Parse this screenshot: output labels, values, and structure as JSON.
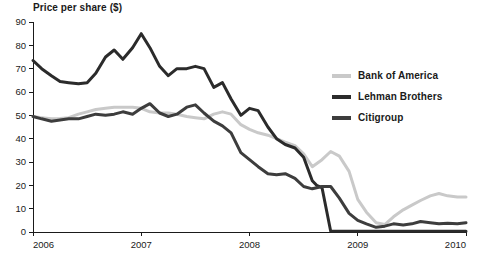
{
  "chart_data": {
    "type": "line",
    "title": "Price per share ($)",
    "xlabel": "",
    "ylabel": "Price per share ($)",
    "xlim": [
      2006,
      2010
    ],
    "ylim": [
      0,
      90
    ],
    "grid": false,
    "legend_position": "right",
    "y_ticks": [
      0,
      10,
      20,
      30,
      40,
      50,
      60,
      70,
      80,
      90
    ],
    "y_tick_labels": [
      "0",
      "10",
      "20",
      "30",
      "40",
      "50",
      "60",
      "70",
      "80",
      "90"
    ],
    "x_ticks": [
      2006,
      2007,
      2008,
      2009,
      2010
    ],
    "x_tick_labels": [
      "2006",
      "2007",
      "2008",
      "2009",
      "2010"
    ],
    "series": [
      {
        "name": "Bank of America",
        "color": "#c9c9c9",
        "width": 3.0,
        "x": [
          2006.0,
          2006.08,
          2006.17,
          2006.25,
          2006.33,
          2006.42,
          2006.5,
          2006.58,
          2006.67,
          2006.75,
          2006.83,
          2006.92,
          2007.0,
          2007.08,
          2007.17,
          2007.25,
          2007.33,
          2007.42,
          2007.5,
          2007.58,
          2007.67,
          2007.75,
          2007.83,
          2007.92,
          2008.0,
          2008.08,
          2008.17,
          2008.25,
          2008.33,
          2008.42,
          2008.5,
          2008.58,
          2008.67,
          2008.75,
          2008.83,
          2008.92,
          2009.0,
          2009.08,
          2009.17,
          2009.25,
          2009.33,
          2009.42,
          2009.5,
          2009.58,
          2009.67,
          2009.75,
          2009.83,
          2009.92,
          2010.0
        ],
        "values": [
          49.5,
          49.0,
          48.5,
          48.6,
          49.0,
          50.5,
          51.5,
          52.5,
          53.0,
          53.5,
          53.5,
          53.5,
          53.0,
          51.5,
          51.0,
          51.0,
          50.5,
          49.5,
          49.0,
          48.5,
          50.5,
          51.5,
          50.5,
          46.0,
          44.0,
          42.5,
          41.5,
          40.0,
          38.5,
          37.0,
          33.5,
          28.0,
          31.0,
          34.5,
          32.5,
          26.0,
          14.0,
          8.5,
          4.0,
          3.2,
          6.5,
          9.5,
          11.5,
          13.5,
          15.5,
          16.5,
          15.5,
          15.0,
          15.0
        ]
      },
      {
        "name": "Lehman Brothers",
        "color": "#2b2b2b",
        "width": 3.0,
        "x": [
          2006.0,
          2006.08,
          2006.17,
          2006.25,
          2006.33,
          2006.42,
          2006.5,
          2006.58,
          2006.67,
          2006.75,
          2006.83,
          2006.92,
          2007.0,
          2007.08,
          2007.17,
          2007.25,
          2007.33,
          2007.42,
          2007.5,
          2007.58,
          2007.67,
          2007.75,
          2007.83,
          2007.92,
          2008.0,
          2008.08,
          2008.17,
          2008.25,
          2008.33,
          2008.42,
          2008.5,
          2008.58,
          2008.62,
          2008.67,
          2008.75,
          2008.83,
          2008.92,
          2009.0,
          2009.25,
          2009.5,
          2009.75,
          2010.0
        ],
        "values": [
          73.5,
          70.0,
          67.0,
          64.5,
          64.0,
          63.5,
          64.0,
          68.0,
          75.0,
          78.0,
          74.0,
          79.0,
          85.0,
          79.0,
          71.0,
          67.0,
          70.0,
          70.0,
          71.0,
          70.0,
          62.0,
          64.0,
          57.0,
          50.0,
          53.0,
          52.0,
          45.0,
          40.0,
          37.5,
          36.0,
          32.0,
          22.0,
          20.0,
          19.0,
          0.3,
          0.3,
          0.3,
          0.3,
          0.3,
          0.3,
          0.3,
          0.3
        ]
      },
      {
        "name": "Citigroup",
        "color": "#3d3d3d",
        "width": 3.0,
        "x": [
          2006.0,
          2006.08,
          2006.17,
          2006.25,
          2006.33,
          2006.42,
          2006.5,
          2006.58,
          2006.67,
          2006.75,
          2006.83,
          2006.92,
          2007.0,
          2007.08,
          2007.17,
          2007.25,
          2007.33,
          2007.42,
          2007.5,
          2007.58,
          2007.67,
          2007.75,
          2007.83,
          2007.92,
          2008.0,
          2008.08,
          2008.17,
          2008.25,
          2008.33,
          2008.42,
          2008.5,
          2008.58,
          2008.67,
          2008.75,
          2008.83,
          2008.92,
          2009.0,
          2009.08,
          2009.17,
          2009.25,
          2009.33,
          2009.42,
          2009.5,
          2009.58,
          2009.67,
          2009.75,
          2009.83,
          2009.92,
          2010.0
        ],
        "values": [
          49.5,
          48.5,
          47.5,
          48.0,
          48.5,
          48.5,
          49.5,
          50.5,
          50.0,
          50.5,
          51.5,
          50.5,
          53.0,
          55.0,
          51.0,
          49.5,
          50.5,
          53.5,
          54.5,
          51.0,
          47.5,
          45.5,
          42.5,
          34.0,
          31.0,
          28.0,
          25.0,
          24.5,
          25.0,
          23.0,
          19.5,
          18.5,
          19.5,
          19.5,
          14.5,
          8.0,
          5.0,
          3.5,
          2.0,
          2.5,
          3.5,
          3.0,
          3.5,
          4.5,
          4.0,
          3.5,
          3.8,
          3.5,
          4.0
        ]
      }
    ]
  },
  "legend": {
    "items": [
      {
        "label": "Bank of America",
        "color": "#c9c9c9"
      },
      {
        "label": "Lehman Brothers",
        "color": "#2b2b2b"
      },
      {
        "label": "Citigroup",
        "color": "#3d3d3d"
      }
    ]
  }
}
